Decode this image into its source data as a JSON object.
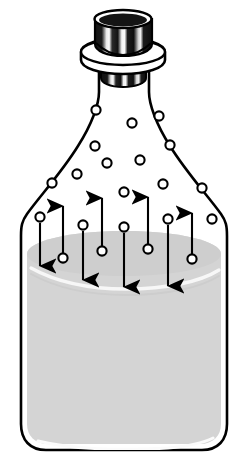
{
  "figure": {
    "caption": ""
  },
  "colors": {
    "background": "#ffffff",
    "outline": "#000000",
    "liquid_fill": "#d4d4d4",
    "liquid_fill_dark": "#c9c9c9",
    "liquid_surface_highlight": "#f2f2f2",
    "vapor_fill": "#ffffff",
    "molecule_fill": "#ffffff",
    "molecule_stroke": "#000000",
    "stopper_fill": "#111111",
    "stopper_highlight": "#f6f6f6",
    "collar_fill": "#ffffff",
    "arrow_color": "#000000"
  },
  "geometry": {
    "canvas_width": 247,
    "canvas_height": 467,
    "bottle": {
      "body_left_x": 20,
      "body_right_x": 228,
      "body_bottom_y": 452,
      "shoulder_top_y": 86,
      "neck_left_x": 99,
      "neck_right_x": 148,
      "corner_radius": 30
    },
    "liquid": {
      "surface_center_y": 248,
      "surface_edge_y": 258,
      "bottom_y": 446
    },
    "stopper": {
      "x": 95,
      "y": 10,
      "width": 57,
      "height": 43
    },
    "collar": {
      "cx": 123,
      "cy": 57,
      "rx": 42,
      "ry": 13
    }
  },
  "labels": {
    "liquid_region": "liquid",
    "vapor_region": "vapor",
    "stopper": "stopper",
    "neck_collar": "bottle collar",
    "bottle_body": "bottle body",
    "evaporating_molecule": "evaporating molecule",
    "condensing_molecule": "condensing molecule",
    "vapor_molecule": "vapor molecule"
  },
  "chart_data": {
    "type": "diagram",
    "vapor_molecules": [
      {
        "cx": 96,
        "cy": 110,
        "r": 4.6
      },
      {
        "cx": 132,
        "cy": 123,
        "r": 4.6
      },
      {
        "cx": 159,
        "cy": 116,
        "r": 4.6
      },
      {
        "cx": 95,
        "cy": 146,
        "r": 4.6
      },
      {
        "cx": 170,
        "cy": 145,
        "r": 4.6
      },
      {
        "cx": 107,
        "cy": 163,
        "r": 4.6
      },
      {
        "cx": 140,
        "cy": 160,
        "r": 4.6
      },
      {
        "cx": 77,
        "cy": 174,
        "r": 4.6
      },
      {
        "cx": 52,
        "cy": 183,
        "r": 4.6
      },
      {
        "cx": 163,
        "cy": 184,
        "r": 4.6
      },
      {
        "cx": 202,
        "cy": 188,
        "r": 4.6
      },
      {
        "cx": 124,
        "cy": 192,
        "r": 4.6
      },
      {
        "cx": 212,
        "cy": 219,
        "r": 4.6
      }
    ],
    "evaporation_arrows": [
      {
        "x": 63,
        "y_tail": 258,
        "y_head": 205,
        "molecule_cy": 258
      },
      {
        "x": 102,
        "y_tail": 251,
        "y_head": 197,
        "molecule_cy": 251
      },
      {
        "x": 148,
        "y_tail": 249,
        "y_head": 196,
        "molecule_cy": 249
      },
      {
        "x": 192,
        "y_tail": 259,
        "y_head": 212,
        "molecule_cy": 259
      }
    ],
    "condensation_arrows": [
      {
        "x": 40,
        "y_tail": 222,
        "y_head": 267,
        "molecule_cy": 217
      },
      {
        "x": 83,
        "y_tail": 230,
        "y_head": 281,
        "molecule_cy": 225
      },
      {
        "x": 124,
        "y_tail": 232,
        "y_head": 288,
        "molecule_cy": 227
      },
      {
        "x": 168,
        "y_tail": 224,
        "y_head": 287,
        "molecule_cy": 219
      }
    ],
    "counts": {
      "vapor_molecules": 13,
      "evaporation_arrows": 4,
      "condensation_arrows": 4
    },
    "legend": [],
    "annotations": []
  }
}
